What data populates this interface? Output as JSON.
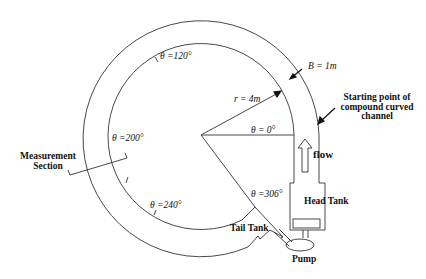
{
  "diagram": {
    "type": "compound curved open channel schematic",
    "labels": {
      "theta_120": "θ =120°",
      "theta_200": "θ =200°",
      "theta_240": "θ =240°",
      "theta_306": "θ =306°",
      "theta_0": "θ = 0°",
      "radius": "r = 4m",
      "width": "B = 1m",
      "start_line1": "Starting point of",
      "start_line2": "compound curved",
      "start_line3": "channel",
      "flow": "flow",
      "measurement_line1": "Measurement",
      "measurement_line2": "Section",
      "head_tank": "Head Tank",
      "tail_tank": "Tail Tank",
      "pump": "Pump"
    },
    "geometry": {
      "radius_m": 4,
      "width_m": 1,
      "angles_deg": [
        0,
        120,
        200,
        240,
        306
      ]
    },
    "colors": {
      "line": "#333333",
      "text": "#111111",
      "background": "#ffffff"
    }
  }
}
